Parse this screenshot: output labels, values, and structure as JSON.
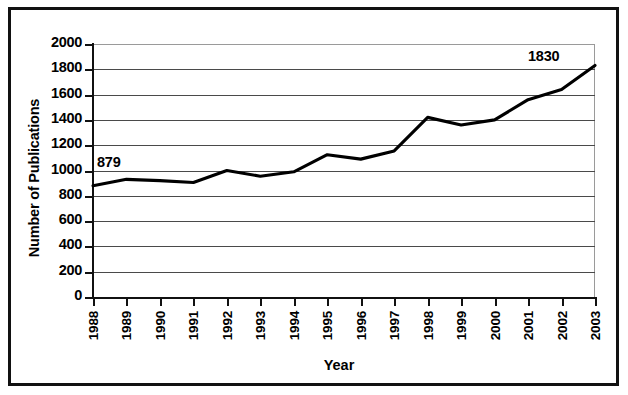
{
  "chart_data": {
    "type": "line",
    "title": "",
    "xlabel": "Year",
    "ylabel": "Number of Publications",
    "categories": [
      "1988",
      "1989",
      "1990",
      "1991",
      "1992",
      "1993",
      "1994",
      "1995",
      "1996",
      "1997",
      "1998",
      "1999",
      "2000",
      "2001",
      "2002",
      "2003"
    ],
    "values": [
      879,
      930,
      920,
      905,
      1000,
      955,
      990,
      1125,
      1090,
      1155,
      1420,
      1360,
      1400,
      1560,
      1640,
      1830
    ],
    "series": [
      {
        "name": "Number of Publications",
        "values": [
          879,
          930,
          920,
          905,
          1000,
          955,
          990,
          1125,
          1090,
          1155,
          1420,
          1360,
          1400,
          1560,
          1640,
          1830
        ]
      }
    ],
    "ylim": [
      0,
      2000
    ],
    "y_ticks": [
      0,
      200,
      400,
      600,
      800,
      1000,
      1200,
      1400,
      1600,
      1800,
      2000
    ],
    "y_tick_labels": [
      "0",
      "200",
      "400",
      "600",
      "800",
      "1000",
      "1200",
      "1400",
      "1600",
      "1800",
      "2000"
    ],
    "grid": true,
    "legend": false,
    "legend_position": "none",
    "line_color": "#000000",
    "annotations": [
      {
        "label": "879",
        "x": "1988",
        "value": 879
      },
      {
        "label": "1830",
        "x": "2003",
        "value": 1830
      }
    ]
  },
  "axes": {
    "y_title": "Number of Publications",
    "x_title": "Year"
  },
  "colors": {
    "line": "#000000",
    "grid": "#4a4a4a",
    "frame": "#111111",
    "background": "#ffffff"
  }
}
